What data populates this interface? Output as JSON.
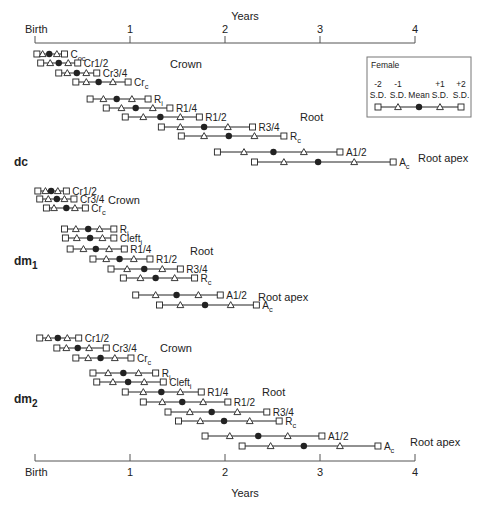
{
  "chart_data": {
    "type": "range-timeline",
    "title": "",
    "xlabel": "Years",
    "x_ticks": [
      "Birth",
      "1",
      "2",
      "3",
      "4"
    ],
    "x_range": [
      0,
      4
    ],
    "legend": {
      "title": "Female",
      "markers": [
        {
          "top": "-2",
          "bottom": "S.D.",
          "symbol": "square"
        },
        {
          "top": "-1",
          "bottom": "S.D.",
          "symbol": "triangle"
        },
        {
          "top": "",
          "bottom": "Mean",
          "symbol": "dot"
        },
        {
          "top": "+1",
          "bottom": "S.D.",
          "symbol": "triangle"
        },
        {
          "top": "+2",
          "bottom": "S.D.",
          "symbol": "square"
        }
      ]
    },
    "groups": [
      {
        "name": "dc",
        "sub": "",
        "label_y": 166,
        "phases": [
          {
            "label": "Crown",
            "x": 170,
            "y": 68
          },
          {
            "label": "Root",
            "x": 300,
            "y": 121
          },
          {
            "label": "Root apex",
            "x": 418,
            "y": 162
          }
        ],
        "stages": [
          {
            "stage": "C",
            "sub": "oc",
            "y": 54,
            "years": [
              0.02,
              0.08,
              0.15,
              0.23,
              0.31
            ]
          },
          {
            "stage": "Cr1/2",
            "sub": "",
            "y": 63,
            "years": [
              0.06,
              0.16,
              0.25,
              0.35,
              0.45
            ]
          },
          {
            "stage": "Cr3/4",
            "sub": "",
            "y": 73,
            "years": [
              0.25,
              0.34,
              0.44,
              0.54,
              0.65
            ]
          },
          {
            "stage": "Cr",
            "sub": "c",
            "y": 82,
            "years": [
              0.43,
              0.54,
              0.67,
              0.82,
              0.98
            ]
          },
          {
            "stage": "R",
            "sub": "i",
            "y": 99,
            "years": [
              0.58,
              0.72,
              0.86,
              1.02,
              1.19
            ]
          },
          {
            "stage": "R1/4",
            "sub": "",
            "y": 108,
            "years": [
              0.75,
              0.91,
              1.06,
              1.24,
              1.42
            ]
          },
          {
            "stage": "R1/2",
            "sub": "",
            "y": 117,
            "years": [
              0.95,
              1.14,
              1.32,
              1.53,
              1.73
            ]
          },
          {
            "stage": "R3/4",
            "sub": "",
            "y": 127,
            "years": [
              1.33,
              1.53,
              1.78,
              2.03,
              2.29
            ]
          },
          {
            "stage": "R",
            "sub": "c",
            "y": 136,
            "years": [
              1.54,
              1.78,
              2.04,
              2.31,
              2.62
            ]
          },
          {
            "stage": "A1/2",
            "sub": "",
            "y": 152,
            "years": [
              1.92,
              2.2,
              2.51,
              2.83,
              3.21
            ]
          },
          {
            "stage": "A",
            "sub": "c",
            "y": 162,
            "years": [
              2.31,
              2.62,
              2.98,
              3.36,
              3.77
            ]
          }
        ]
      },
      {
        "name": "dm",
        "sub": "1",
        "label_y": 265,
        "phases": [
          {
            "label": "Crown",
            "x": 108,
            "y": 204
          },
          {
            "label": "Root",
            "x": 190,
            "y": 255
          },
          {
            "label": "Root apex",
            "x": 258,
            "y": 301
          }
        ],
        "stages": [
          {
            "stage": "Cr1/2",
            "sub": "",
            "y": 191,
            "years": [
              0.03,
              0.11,
              0.17,
              0.24,
              0.33
            ]
          },
          {
            "stage": "Cr3/4",
            "sub": "",
            "y": 199,
            "years": [
              0.05,
              0.14,
              0.23,
              0.31,
              0.41
            ]
          },
          {
            "stage": "Cr",
            "sub": "c",
            "y": 208,
            "years": [
              0.12,
              0.2,
              0.33,
              0.42,
              0.53
            ]
          },
          {
            "stage": "R",
            "sub": "i",
            "y": 229,
            "years": [
              0.31,
              0.43,
              0.56,
              0.68,
              0.83
            ]
          },
          {
            "stage": "Cleft",
            "sub": "i",
            "y": 238,
            "years": [
              0.32,
              0.44,
              0.58,
              0.71,
              0.83
            ]
          },
          {
            "stage": "R1/4",
            "sub": "",
            "y": 249,
            "years": [
              0.37,
              0.51,
              0.64,
              0.78,
              0.94
            ]
          },
          {
            "stage": "R1/2",
            "sub": "",
            "y": 259,
            "years": [
              0.61,
              0.75,
              0.89,
              1.04,
              1.21
            ]
          },
          {
            "stage": "R3/4",
            "sub": "",
            "y": 269,
            "years": [
              0.8,
              0.97,
              1.15,
              1.34,
              1.53
            ]
          },
          {
            "stage": "R",
            "sub": "c",
            "y": 278,
            "years": [
              0.93,
              1.11,
              1.27,
              1.47,
              1.68
            ]
          },
          {
            "stage": "A1/2",
            "sub": "",
            "y": 295,
            "years": [
              1.06,
              1.27,
              1.49,
              1.72,
              1.95
            ]
          },
          {
            "stage": "A",
            "sub": "c",
            "y": 305,
            "years": [
              1.31,
              1.53,
              1.79,
              2.06,
              2.33
            ]
          }
        ]
      },
      {
        "name": "dm",
        "sub": "2",
        "label_y": 403,
        "phases": [
          {
            "label": "Crown",
            "x": 160,
            "y": 352
          },
          {
            "label": "Root",
            "x": 262,
            "y": 396
          },
          {
            "label": "Root apex",
            "x": 410,
            "y": 446
          }
        ],
        "stages": [
          {
            "stage": "Cr1/2",
            "sub": "",
            "y": 338,
            "years": [
              0.05,
              0.14,
              0.24,
              0.34,
              0.46
            ]
          },
          {
            "stage": "Cr3/4",
            "sub": "",
            "y": 348,
            "years": [
              0.23,
              0.33,
              0.45,
              0.57,
              0.75
            ]
          },
          {
            "stage": "Cr",
            "sub": "c",
            "y": 358,
            "years": [
              0.43,
              0.56,
              0.69,
              0.84,
              1.01
            ]
          },
          {
            "stage": "R",
            "sub": "i",
            "y": 373,
            "years": [
              0.61,
              0.77,
              0.93,
              1.09,
              1.27
            ]
          },
          {
            "stage": "Cleft",
            "sub": "i",
            "y": 382,
            "years": [
              0.65,
              0.82,
              0.98,
              1.15,
              1.35
            ]
          },
          {
            "stage": "R1/4",
            "sub": "",
            "y": 392,
            "years": [
              0.95,
              1.14,
              1.33,
              1.53,
              1.75
            ]
          },
          {
            "stage": "R1/2",
            "sub": "",
            "y": 402,
            "years": [
              1.14,
              1.34,
              1.55,
              1.77,
              2.03
            ]
          },
          {
            "stage": "R3/4",
            "sub": "",
            "y": 412,
            "years": [
              1.4,
              1.63,
              1.86,
              2.13,
              2.44
            ]
          },
          {
            "stage": "R",
            "sub": "c",
            "y": 421,
            "years": [
              1.51,
              1.74,
              1.99,
              2.26,
              2.57
            ]
          },
          {
            "stage": "A1/2",
            "sub": "",
            "y": 436,
            "years": [
              1.79,
              2.05,
              2.35,
              2.66,
              3.02
            ]
          },
          {
            "stage": "A",
            "sub": "c",
            "y": 446,
            "years": [
              2.18,
              2.48,
              2.83,
              3.21,
              3.61
            ]
          }
        ]
      }
    ]
  },
  "axis": {
    "top_title": "Years",
    "bottom_title": "Years",
    "birth_label": "Birth"
  },
  "colors": {
    "ink": "#222222",
    "axis": "#555555",
    "legend_border": "#777777"
  }
}
